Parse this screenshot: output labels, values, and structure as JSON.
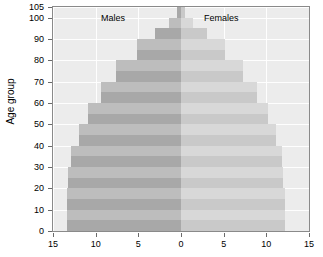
{
  "chart_data": {
    "type": "bar",
    "subtype": "population-pyramid",
    "title": "",
    "xlabel": "",
    "ylabel": "Age group",
    "grid": true,
    "legend_position": "inside-top",
    "axis": {
      "y_title": "Age group",
      "y_ticks": [
        0,
        10,
        20,
        30,
        40,
        50,
        60,
        70,
        80,
        90,
        100,
        105
      ],
      "y_tick_labels": [
        "0",
        "10",
        "20",
        "30",
        "40",
        "50",
        "60",
        "70",
        "80",
        "90",
        "100",
        "105"
      ],
      "ylim": [
        0,
        105
      ],
      "x_ticks": [
        -15,
        -10,
        -5,
        0,
        5,
        10,
        15
      ],
      "x_tick_labels": [
        "15",
        "10",
        "5",
        "0",
        "5",
        "10",
        "15"
      ],
      "xlim": [
        -15,
        15
      ]
    },
    "series": [
      {
        "name": "Males",
        "side": "left",
        "color": "#a8a8a8",
        "alt_color": "#bdbdbd"
      },
      {
        "name": "Females",
        "side": "right",
        "color": "#c9c9c9",
        "alt_color": "#d8d8d8"
      }
    ],
    "categories": [
      "0-4",
      "5-9",
      "10-14",
      "15-19",
      "20-24",
      "25-29",
      "30-34",
      "35-39",
      "40-44",
      "45-49",
      "50-54",
      "55-59",
      "60-64",
      "65-69",
      "70-74",
      "75-79",
      "80-84",
      "85-89",
      "90-94",
      "95-99",
      "100-104"
    ],
    "males": [
      13.4,
      13.4,
      13.4,
      13.4,
      13.2,
      13.2,
      12.9,
      12.9,
      12.0,
      12.0,
      10.9,
      10.9,
      9.4,
      9.4,
      7.6,
      7.6,
      5.2,
      5.2,
      3.0,
      1.4,
      0.5
    ],
    "females": [
      12.2,
      12.2,
      12.2,
      12.2,
      12.0,
      12.0,
      11.8,
      11.8,
      11.1,
      11.1,
      10.2,
      10.2,
      8.9,
      8.9,
      7.3,
      7.3,
      5.1,
      5.1,
      3.0,
      1.4,
      0.5
    ],
    "annotations": [
      {
        "text": "Males",
        "x": -8.0,
        "y": 100
      },
      {
        "text": "Females",
        "x": 5.0,
        "y": 100
      }
    ]
  },
  "colors": {
    "plot_background": "#ececec",
    "gridline": "#ffffff",
    "frame": "#8a8a8a",
    "page_background": "#ffffff",
    "text": "#000000"
  }
}
